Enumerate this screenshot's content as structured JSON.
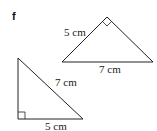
{
  "part_label": "f",
  "triangles": [
    {
      "name": "upper-triangle",
      "right_angle_at": "apex",
      "labels": {
        "leg": "5 cm",
        "hypotenuse": "7 cm"
      }
    },
    {
      "name": "lower-triangle",
      "right_angle_at": "bottom-left",
      "labels": {
        "hypotenuse": "7 cm",
        "leg": "5 cm"
      }
    }
  ],
  "colors": {
    "stroke": "#222222",
    "background": "#ffffff"
  }
}
